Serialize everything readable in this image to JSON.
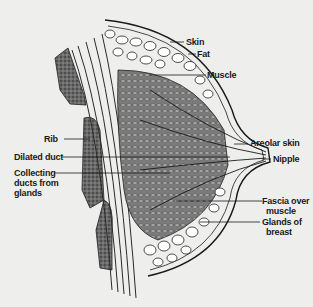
{
  "figure": {
    "colors": {
      "background": "#eeeeec",
      "ink": "#1a1a1a",
      "tissue": "#4a4a4a",
      "fat": "#ffffff"
    }
  },
  "labels": {
    "skin": "Skin",
    "fat": "Fat",
    "muscle": "Muscle",
    "rib": "Rib",
    "dilated_duct": "Dilated duct",
    "collecting_ducts_1": "Collecting",
    "collecting_ducts_2": "ducts from",
    "collecting_ducts_3": "glands",
    "areolar_skin": "Areolar skin",
    "nipple": "Nipple",
    "fascia_1": "Fascia over",
    "fascia_2": "muscle",
    "glands_1": "Glands of",
    "glands_2": "breast"
  }
}
